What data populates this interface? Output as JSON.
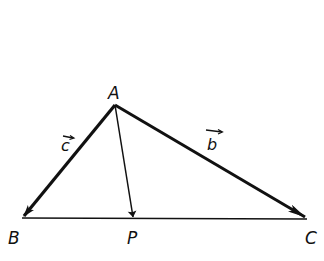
{
  "diagram": {
    "type": "vector triangle",
    "points": {
      "A": {
        "label": "A",
        "x": 115,
        "y": 105
      },
      "B": {
        "label": "B",
        "x": 22,
        "y": 218
      },
      "P": {
        "label": "P",
        "x": 134,
        "y": 219
      },
      "C": {
        "label": "C",
        "x": 307,
        "y": 219
      }
    },
    "vectors": {
      "c": {
        "label": "c",
        "from": "A",
        "to": "B"
      },
      "b": {
        "label": "b",
        "from": "A",
        "to": "C"
      },
      "AP": {
        "label": "",
        "from": "A",
        "to": "P"
      }
    },
    "segments": [
      {
        "from": "B",
        "to": "C"
      }
    ],
    "stroke_color": "#111111",
    "background": "#ffffff"
  }
}
